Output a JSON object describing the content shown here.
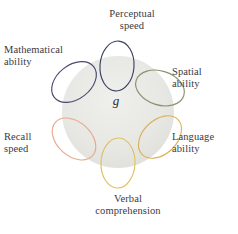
{
  "diagram": {
    "title_text": "g",
    "center": {
      "label": "g",
      "name": "general-intelligence-factor",
      "cx": 118,
      "cy": 112,
      "radius": 56,
      "fill": "#e6e6e2"
    },
    "background_color": "#ffffff",
    "nodes": [
      {
        "id": "perceptual-speed",
        "label": "Perceptual\nspeed",
        "color": "#3c4260",
        "cx": 117,
        "cy": 66,
        "rx": 17,
        "ry": 25,
        "rotation": 4
      },
      {
        "id": "mathematical-ability",
        "label": "Mathematical\nability",
        "color": "#4a4a70",
        "cx": 74,
        "cy": 82,
        "rx": 17,
        "ry": 25,
        "rotation": 52
      },
      {
        "id": "spatial-ability",
        "label": "Spatial\nability",
        "color": "#8d9170",
        "cx": 160,
        "cy": 88,
        "rx": 17,
        "ry": 25,
        "rotation": 108
      },
      {
        "id": "language-ability",
        "label": "Language\nability",
        "color": "#dbb25c",
        "cx": 160,
        "cy": 137,
        "rx": 17,
        "ry": 25,
        "rotation": 46
      },
      {
        "id": "verbal-comprehension",
        "label": "Verbal\ncomprehension",
        "color": "#e0c060",
        "cx": 118,
        "cy": 163,
        "rx": 17,
        "ry": 25,
        "rotation": 2
      },
      {
        "id": "recall-speed",
        "label": "Recall\nspeed",
        "color": "#e8a98a",
        "cx": 74,
        "cy": 139,
        "rx": 17,
        "ry": 25,
        "rotation": 132
      }
    ]
  }
}
